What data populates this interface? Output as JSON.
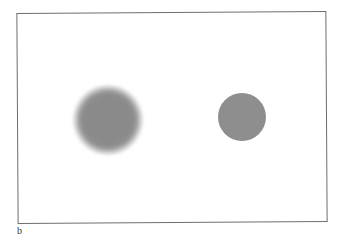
{
  "figure": {
    "panel_label": "b",
    "frame_color": "#6e6e6e",
    "shapes": [
      {
        "name": "blurred-disk",
        "type": "circle",
        "edge": "blurred",
        "color": "#8a8a8a"
      },
      {
        "name": "sharp-disk",
        "type": "circle",
        "edge": "sharp",
        "color": "#8e8e8e"
      }
    ]
  }
}
